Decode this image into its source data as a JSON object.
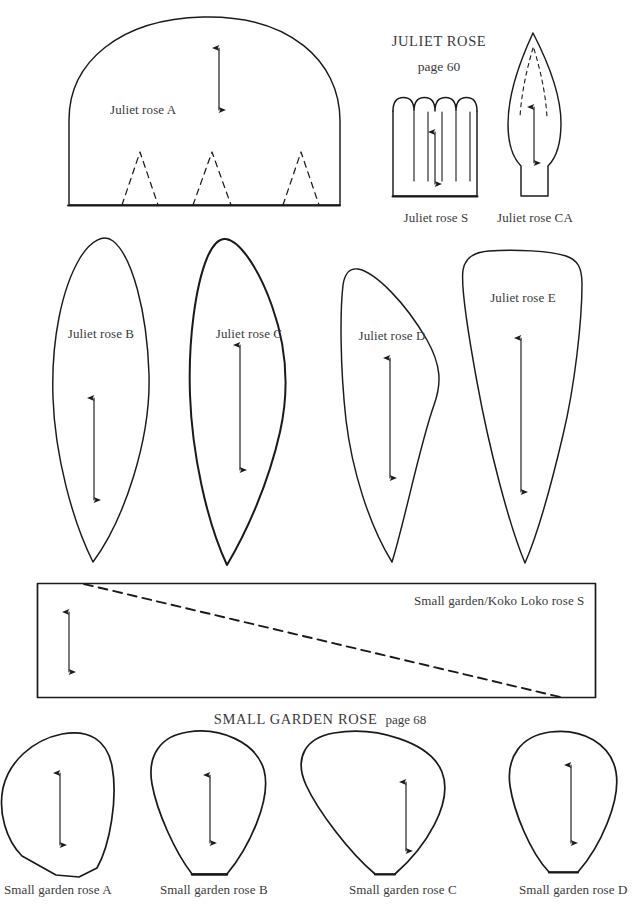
{
  "page": {
    "background_color": "#ffffff",
    "ink_color": "#1a1a1a",
    "text_color": "#3a3a3a",
    "width": 640,
    "height": 920
  },
  "headings": {
    "juliet_title": "JULIET ROSE",
    "juliet_page": "page 60",
    "small_garden_title": "SMALL GARDEN ROSE",
    "small_garden_page": "page 68"
  },
  "templates": {
    "juliet_a": {
      "label": "Juliet rose A",
      "shape": "dome-with-dart-triangles",
      "arrow": "grain-line-double-arrow",
      "darts": 3
    },
    "juliet_s": {
      "label": "Juliet rose S",
      "shape": "scalloped-strip",
      "scallops": 6,
      "slits": 5,
      "arrow": "grain-line-double-arrow"
    },
    "juliet_ca": {
      "label": "Juliet rose CA",
      "shape": "pointed-calyx-leaf",
      "arrow": "grain-line-double-arrow",
      "dashed_inner_lines": 2
    },
    "juliet_b": {
      "label": "Juliet rose B",
      "shape": "narrow-pointed-petal",
      "arrow": "grain-line-double-arrow"
    },
    "juliet_c": {
      "label": "Juliet rose C",
      "shape": "angled-pointed-petal",
      "arrow": "grain-line-double-arrow"
    },
    "juliet_d": {
      "label": "Juliet rose D",
      "shape": "curved-pointed-petal",
      "arrow": "grain-line-double-arrow"
    },
    "juliet_e": {
      "label": "Juliet rose E",
      "shape": "broad-tapered-petal",
      "arrow": "grain-line-double-arrow"
    },
    "koko_loko_s": {
      "label": "Small garden/Koko Loko rose S",
      "shape": "rectangle-strip-with-diagonal",
      "arrow": "grain-line-double-arrow",
      "diagonal": "dashed-cut-line"
    },
    "small_garden_a": {
      "label": "Small garden rose A",
      "shape": "rounded-flat-base-petal",
      "arrow": "grain-line-double-arrow"
    },
    "small_garden_b": {
      "label": "Small garden rose B",
      "shape": "teardrop-flat-base-petal",
      "arrow": "grain-line-double-arrow"
    },
    "small_garden_c": {
      "label": "Small garden rose C",
      "shape": "wide-teardrop-petal",
      "arrow": "grain-line-double-arrow"
    },
    "small_garden_d": {
      "label": "Small garden rose D",
      "shape": "narrow-teardrop-petal",
      "arrow": "grain-line-double-arrow"
    }
  }
}
